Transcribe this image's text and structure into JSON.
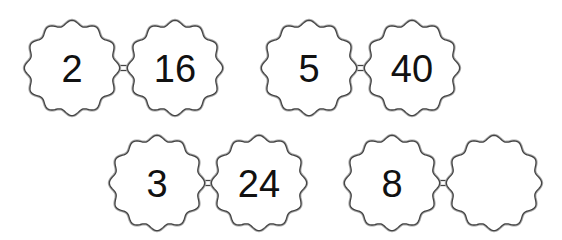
{
  "diagram": {
    "type": "number-pair-links",
    "stroke_color": "#444444",
    "fill_color": "#ffffff",
    "text_color": "#111111",
    "pairs": [
      {
        "left": "2",
        "right": "16"
      },
      {
        "left": "5",
        "right": "40"
      },
      {
        "left": "3",
        "right": "24"
      },
      {
        "left": "8",
        "right": ""
      }
    ]
  }
}
